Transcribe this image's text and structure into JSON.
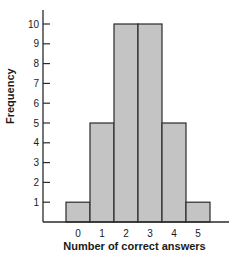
{
  "chart_data": {
    "type": "bar",
    "title": "",
    "xlabel": "Number of correct answers",
    "ylabel": "Frequency",
    "categories": [
      "0",
      "1",
      "2",
      "3",
      "4",
      "5"
    ],
    "values": [
      1,
      5,
      10,
      10,
      5,
      1
    ],
    "yticks": [
      1,
      2,
      3,
      4,
      5,
      6,
      7,
      8,
      9,
      10
    ],
    "ylim": [
      0,
      10.7
    ],
    "grid": false,
    "legend": null,
    "bar_color": "#c4c4c4",
    "edge_color": "#2a2a2a",
    "histogram_style": true
  },
  "labels": {
    "xlabel": "Number of correct answers",
    "ylabel": "Frequency"
  }
}
